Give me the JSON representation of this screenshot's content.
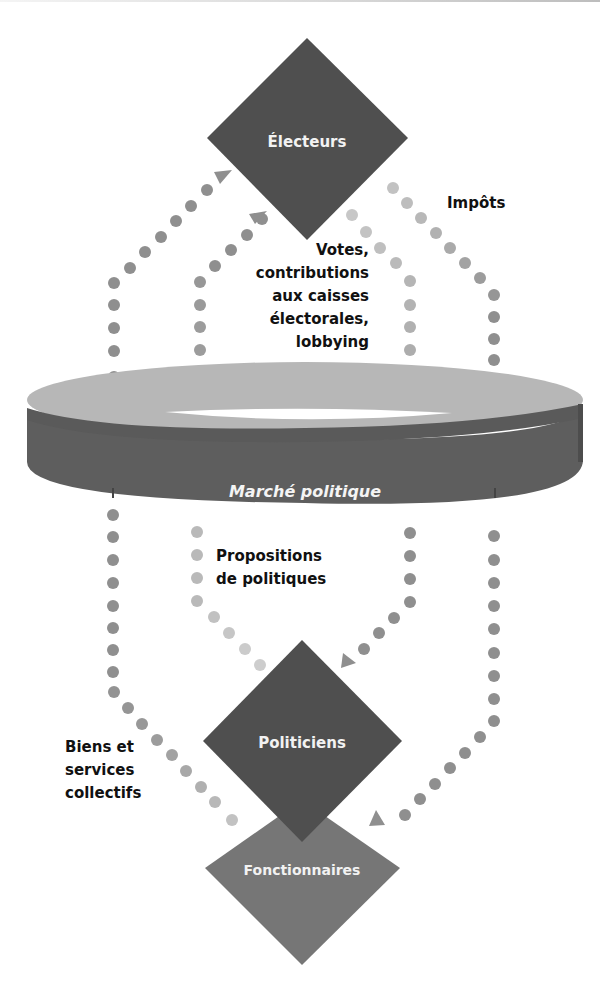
{
  "diagram": {
    "title": "Marché politique",
    "colors": {
      "node_dark": "#4f4f4f",
      "node_mid": "#767676",
      "ring_top": "#b9b9b9",
      "ring_band": "#5e5e5e",
      "dot_dark": "#8e8e8e",
      "dot_light": "#bdbdbd",
      "text": "#111111"
    },
    "nodes": {
      "electeurs": {
        "label": "Électeurs"
      },
      "marche": {
        "label": "Marché politique"
      },
      "politiciens": {
        "label": "Politiciens"
      },
      "fonctionnaires": {
        "label": "Fonctionnaires"
      }
    },
    "flows": {
      "votes": {
        "lines": [
          "Votes,",
          "contributions",
          "aux caisses",
          "électorales,",
          "lobbying"
        ],
        "from": "Marché politique",
        "to": "Électeurs"
      },
      "impots": {
        "lines": [
          "Impôts"
        ],
        "from": "Électeurs",
        "to": "Fonctionnaires"
      },
      "propositions": {
        "lines": [
          "Propositions",
          "de politiques"
        ],
        "from": "Marché politique",
        "to": "Politiciens"
      },
      "biens": {
        "lines": [
          "Biens et",
          "services",
          "collectifs"
        ],
        "from": "Fonctionnaires",
        "to": "Électeurs"
      }
    }
  }
}
